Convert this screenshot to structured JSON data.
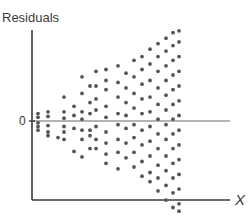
{
  "chart_data": {
    "type": "scatter",
    "title": "",
    "xlabel": "X",
    "ylabel": "Residuals",
    "y_tick_labels": [
      "0"
    ],
    "reference_line": {
      "y": 0,
      "label": "0"
    },
    "grid": false,
    "legend": null,
    "pattern": "residual spread increases with X (funnel / heteroscedasticity)",
    "axis_ranges": {
      "x": [
        0,
        10
      ],
      "y": [
        -1,
        1
      ]
    },
    "colors": {
      "axis": "#3a3a3a",
      "dots": "#555555",
      "zero_line": "#6a6a6a"
    },
    "columns": [
      {
        "x": 0.1,
        "y": [
          0.08,
          0.04,
          -0.02,
          -0.06,
          -0.1
        ]
      },
      {
        "x": 0.6,
        "y": [
          0.1,
          0.05,
          -0.05,
          -0.12,
          -0.16
        ]
      },
      {
        "x": 1.1,
        "y": [
          -0.18
        ]
      },
      {
        "x": 1.4,
        "y": [
          0.26,
          0.1,
          0.03,
          -0.06,
          -0.12,
          -0.2
        ]
      },
      {
        "x": 1.9,
        "y": [
          0.16,
          0.06,
          -0.08,
          -0.33
        ]
      },
      {
        "x": 2.3,
        "y": [
          0.48,
          0.3,
          0.1,
          0.02,
          -0.1,
          -0.2,
          -0.39
        ]
      },
      {
        "x": 2.7,
        "y": [
          0.38,
          0.2,
          0.08,
          -0.1,
          -0.16,
          -0.3
        ]
      },
      {
        "x": 3.0,
        "y": [
          0.54,
          0.38,
          0.24,
          0.12,
          -0.06,
          -0.2,
          -0.3
        ]
      },
      {
        "x": 3.5,
        "y": [
          0.56,
          0.44,
          0.34,
          0.16,
          0.04,
          -0.12,
          -0.24,
          -0.36,
          -0.46
        ]
      },
      {
        "x": 4.1,
        "y": [
          0.6,
          0.42,
          0.26,
          0.08,
          -0.04,
          -0.2,
          -0.34,
          -0.52
        ]
      },
      {
        "x": 4.5,
        "y": [
          0.52,
          0.36,
          0.2,
          0.06,
          -0.08,
          -0.24,
          -0.4
        ]
      },
      {
        "x": 4.9,
        "y": [
          0.66,
          0.48,
          0.3,
          0.14,
          -0.04,
          -0.18,
          -0.34,
          -0.5
        ]
      },
      {
        "x": 5.3,
        "y": [
          0.7,
          0.56,
          0.4,
          0.24,
          0.08,
          -0.1,
          -0.26,
          -0.44,
          -0.6
        ]
      },
      {
        "x": 5.7,
        "y": [
          0.78,
          0.62,
          0.44,
          0.26,
          0.1,
          -0.06,
          -0.22,
          -0.38,
          -0.56,
          -0.66
        ]
      },
      {
        "x": 6.1,
        "y": [
          0.84,
          0.7,
          0.54,
          0.36,
          0.18,
          0.02,
          -0.14,
          -0.3,
          -0.48,
          -0.62,
          -0.76
        ]
      },
      {
        "x": 6.5,
        "y": [
          0.9,
          0.76,
          0.6,
          0.44,
          0.28,
          0.12,
          -0.04,
          -0.2,
          -0.38,
          -0.54,
          -0.7,
          -0.86
        ]
      },
      {
        "x": 6.85,
        "y": [
          0.96,
          0.82,
          0.66,
          0.5,
          0.34,
          0.18,
          0.02,
          -0.14,
          -0.3,
          -0.46,
          -0.62,
          -0.78,
          -0.94
        ]
      },
      {
        "x": 7.15,
        "y": [
          0.98,
          0.86,
          0.7,
          0.54,
          0.38,
          0.22,
          0.06,
          -0.1,
          -0.26,
          -0.42,
          -0.58,
          -0.74,
          -0.9,
          -0.98
        ]
      }
    ]
  }
}
